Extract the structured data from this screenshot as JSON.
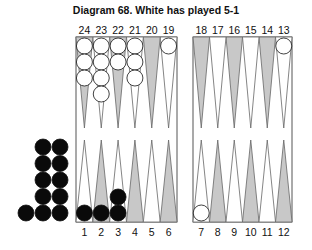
{
  "title": "Diagram 68.  White has played 5-1",
  "colors": {
    "shaded_point": "#c8c8c8",
    "border": "#555555",
    "black_checker": "#0a0a0a",
    "white_checker": "#ffffff"
  },
  "top_labels": [
    "24",
    "23",
    "22",
    "21",
    "20",
    "19",
    "18",
    "17",
    "16",
    "15",
    "14",
    "13"
  ],
  "bottom_labels": [
    "1",
    "2",
    "3",
    "4",
    "5",
    "6",
    "7",
    "8",
    "9",
    "10",
    "11",
    "12"
  ],
  "position": {
    "white": {
      "24": 3,
      "23": 4,
      "22": 2,
      "21": 3,
      "19": 1,
      "13": 1,
      "7": 1
    },
    "black": {
      "1": 1,
      "2": 1,
      "3": 2
    },
    "black_borne_off": 11
  }
}
